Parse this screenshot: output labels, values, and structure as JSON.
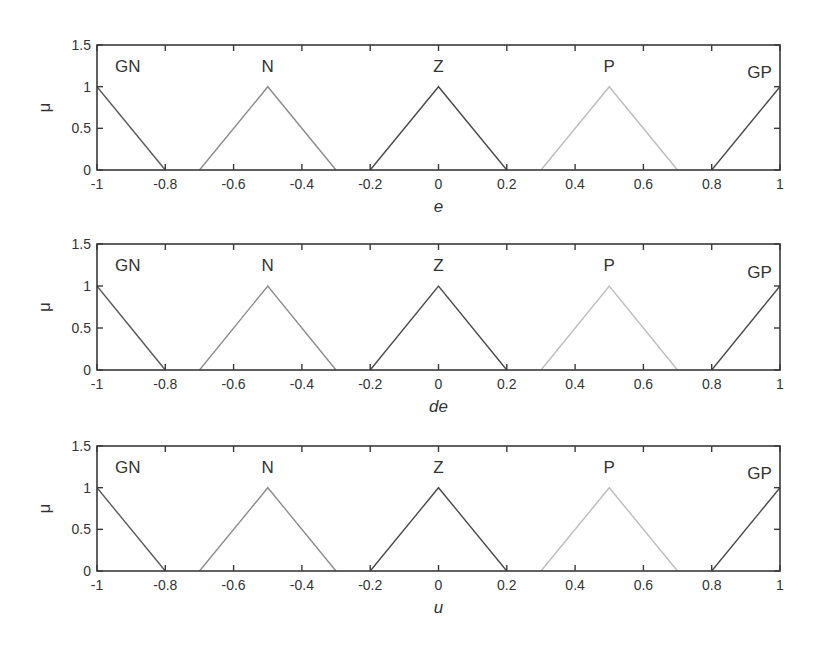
{
  "figure": {
    "subplots": [
      {
        "id": "e",
        "xlabel": "e",
        "ylabel": "μ",
        "box": {
          "left": 97,
          "top": 45,
          "right": 780,
          "bottom": 170
        }
      },
      {
        "id": "de",
        "xlabel": "de",
        "ylabel": "μ",
        "box": {
          "left": 97,
          "top": 244,
          "right": 780,
          "bottom": 370
        }
      },
      {
        "id": "u",
        "xlabel": "u",
        "ylabel": "μ",
        "box": {
          "left": 97,
          "top": 446,
          "right": 780,
          "bottom": 571
        }
      }
    ],
    "xticks": [
      "-1",
      "-0.8",
      "-0.6",
      "-0.4",
      "-0.2",
      "0",
      "0.2",
      "0.4",
      "0.6",
      "0.8",
      "1"
    ],
    "yticks": [
      "0",
      "0.5",
      "1",
      "1.5"
    ]
  },
  "chart_data": [
    {
      "type": "line",
      "title": "",
      "xlabel": "e",
      "ylabel": "μ",
      "xlim": [
        -1,
        1
      ],
      "ylim": [
        0,
        1.5
      ],
      "grid": false,
      "series": [
        {
          "name": "GN",
          "color": "#5a5a5a",
          "x": [
            -1,
            -0.8
          ],
          "y": [
            1,
            0
          ],
          "label_pos": [
            -0.91,
            1.18
          ]
        },
        {
          "name": "N",
          "color": "#8c8c8c",
          "x": [
            -0.7,
            -0.5,
            -0.3
          ],
          "y": [
            0,
            1,
            0
          ],
          "label_pos": [
            -0.5,
            1.18
          ]
        },
        {
          "name": "Z",
          "color": "#4a4a4a",
          "x": [
            -0.2,
            0,
            0.2
          ],
          "y": [
            0,
            1,
            0
          ],
          "label_pos": [
            0,
            1.18
          ]
        },
        {
          "name": "P",
          "color": "#bdbdbd",
          "x": [
            0.3,
            0.5,
            0.7
          ],
          "y": [
            0,
            1,
            0
          ],
          "label_pos": [
            0.5,
            1.18
          ]
        },
        {
          "name": "GP",
          "color": "#4a4a4a",
          "x": [
            0.8,
            1
          ],
          "y": [
            0,
            1
          ],
          "label_pos": [
            0.94,
            1.1
          ]
        }
      ]
    },
    {
      "type": "line",
      "title": "",
      "xlabel": "de",
      "ylabel": "μ",
      "xlim": [
        -1,
        1
      ],
      "ylim": [
        0,
        1.5
      ],
      "grid": false,
      "series": [
        {
          "name": "GN",
          "color": "#5a5a5a",
          "x": [
            -1,
            -0.8
          ],
          "y": [
            1,
            0
          ],
          "label_pos": [
            -0.91,
            1.18
          ]
        },
        {
          "name": "N",
          "color": "#8c8c8c",
          "x": [
            -0.7,
            -0.5,
            -0.3
          ],
          "y": [
            0,
            1,
            0
          ],
          "label_pos": [
            -0.5,
            1.18
          ]
        },
        {
          "name": "Z",
          "color": "#4a4a4a",
          "x": [
            -0.2,
            0,
            0.2
          ],
          "y": [
            0,
            1,
            0
          ],
          "label_pos": [
            0,
            1.18
          ]
        },
        {
          "name": "P",
          "color": "#bdbdbd",
          "x": [
            0.3,
            0.5,
            0.7
          ],
          "y": [
            0,
            1,
            0
          ],
          "label_pos": [
            0.5,
            1.18
          ]
        },
        {
          "name": "GP",
          "color": "#4a4a4a",
          "x": [
            0.8,
            1
          ],
          "y": [
            0,
            1
          ],
          "label_pos": [
            0.94,
            1.1
          ]
        }
      ]
    },
    {
      "type": "line",
      "title": "",
      "xlabel": "u",
      "ylabel": "μ",
      "xlim": [
        -1,
        1
      ],
      "ylim": [
        0,
        1.5
      ],
      "grid": false,
      "series": [
        {
          "name": "GN",
          "color": "#5a5a5a",
          "x": [
            -1,
            -0.8
          ],
          "y": [
            1,
            0
          ],
          "label_pos": [
            -0.91,
            1.18
          ]
        },
        {
          "name": "N",
          "color": "#8c8c8c",
          "x": [
            -0.7,
            -0.5,
            -0.3
          ],
          "y": [
            0,
            1,
            0
          ],
          "label_pos": [
            -0.5,
            1.18
          ]
        },
        {
          "name": "Z",
          "color": "#4a4a4a",
          "x": [
            -0.2,
            0,
            0.2
          ],
          "y": [
            0,
            1,
            0
          ],
          "label_pos": [
            0,
            1.18
          ]
        },
        {
          "name": "P",
          "color": "#bdbdbd",
          "x": [
            0.3,
            0.5,
            0.7
          ],
          "y": [
            0,
            1,
            0
          ],
          "label_pos": [
            0.5,
            1.18
          ]
        },
        {
          "name": "GP",
          "color": "#4a4a4a",
          "x": [
            0.8,
            1
          ],
          "y": [
            0,
            1
          ],
          "label_pos": [
            0.94,
            1.1
          ]
        }
      ]
    }
  ]
}
